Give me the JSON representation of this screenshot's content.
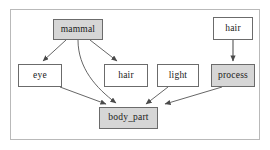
{
  "diagram": {
    "type": "directed-graph",
    "title": "",
    "frame": {
      "visible": true,
      "border_color": "#b9b9b9"
    },
    "colors": {
      "node_fill_highlight": "#d6d6d6",
      "node_fill_plain": "#ffffff",
      "node_border": "#6b6b6b",
      "edge": "#555555",
      "text": "#1a1a1a"
    },
    "nodes": [
      {
        "id": "mammal",
        "label": "mammal",
        "fill": "highlight",
        "x": 53,
        "y": 19,
        "w": 50,
        "h": 21
      },
      {
        "id": "hair_top",
        "label": "hair",
        "fill": "plain",
        "x": 213,
        "y": 17,
        "w": 40,
        "h": 23
      },
      {
        "id": "eye",
        "label": "eye",
        "fill": "plain",
        "x": 18,
        "y": 64,
        "w": 44,
        "h": 23
      },
      {
        "id": "hair_mid",
        "label": "hair",
        "fill": "plain",
        "x": 104,
        "y": 64,
        "w": 44,
        "h": 23
      },
      {
        "id": "light",
        "label": "light",
        "fill": "plain",
        "x": 157,
        "y": 64,
        "w": 42,
        "h": 23
      },
      {
        "id": "process",
        "label": "process",
        "fill": "highlight",
        "x": 211,
        "y": 64,
        "w": 44,
        "h": 23
      },
      {
        "id": "body_part",
        "label": "body_part",
        "fill": "highlight",
        "x": 99,
        "y": 107,
        "w": 59,
        "h": 22
      }
    ],
    "edges": [
      {
        "id": "mammal-eye",
        "from": "mammal",
        "to": "eye",
        "style": "straight"
      },
      {
        "id": "mammal-hair",
        "from": "mammal",
        "to": "hair_mid",
        "style": "straight"
      },
      {
        "id": "mammal-body_part",
        "from": "mammal",
        "to": "body_part",
        "style": "curved"
      },
      {
        "id": "eye-body_part",
        "from": "eye",
        "to": "body_part",
        "style": "straight"
      },
      {
        "id": "light-body_part",
        "from": "light",
        "to": "body_part",
        "style": "straight"
      },
      {
        "id": "process-body_part",
        "from": "process",
        "to": "body_part",
        "style": "straight"
      },
      {
        "id": "hair-process",
        "from": "hair_top",
        "to": "process",
        "style": "straight"
      }
    ]
  }
}
